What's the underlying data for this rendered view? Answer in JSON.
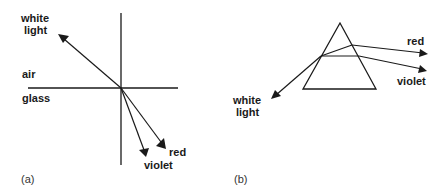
{
  "figure": {
    "panel_a": {
      "caption": "(a)",
      "labels": {
        "white_light_line1": "white",
        "white_light_line2": "light",
        "air": "air",
        "glass": "glass",
        "red": "red",
        "violet": "violet"
      },
      "description": "Refraction of white light at an air-glass boundary, splitting into red and violet rays"
    },
    "panel_b": {
      "caption": "(b)",
      "labels": {
        "white_light_line1": "white",
        "white_light_line2": "light",
        "red": "red",
        "violet": "violet"
      },
      "description": "Dispersion of white light through a triangular prism into red and violet rays"
    },
    "colors": {
      "ink": "#1a1a1a",
      "background": "#ffffff"
    }
  }
}
